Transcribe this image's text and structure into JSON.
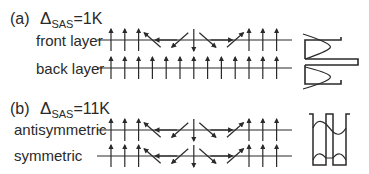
{
  "panels": [
    {
      "tag": "(a)",
      "delta_symbol": "Δ",
      "delta_subscript": "SAS",
      "delta_value": "=1K",
      "rows": [
        {
          "label": "front layer",
          "spins": [
            "up",
            "up",
            "up",
            "nw",
            "w",
            "sw",
            "s",
            "se",
            "e",
            "ne",
            "up",
            "up",
            "up"
          ]
        },
        {
          "label": "back layer",
          "spins": [
            "up",
            "up",
            "up",
            "up",
            "up",
            "up",
            "up",
            "up",
            "up",
            "up",
            "up",
            "up",
            "up"
          ]
        }
      ],
      "profile": "layer-density"
    },
    {
      "tag": "(b)",
      "delta_symbol": "Δ",
      "delta_subscript": "SAS",
      "delta_value": "=11K",
      "rows": [
        {
          "label": "antisymmetric",
          "spins": [
            "up",
            "up",
            "up",
            "nw",
            "w",
            "sw",
            "s",
            "se",
            "e",
            "ne",
            "up",
            "up",
            "up"
          ]
        },
        {
          "label": "symmetric",
          "spins": [
            "up",
            "up",
            "up",
            "nw",
            "w",
            "sw",
            "s",
            "se",
            "e",
            "ne",
            "up",
            "up",
            "up"
          ]
        }
      ],
      "profile": "wavefunction"
    }
  ],
  "colors": {
    "ink": "#2a2a2a",
    "background": "#ffffff"
  }
}
